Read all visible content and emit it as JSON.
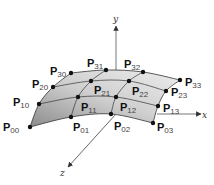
{
  "diagram": {
    "axes": {
      "x": {
        "label": "x",
        "from": [
          116,
          114
        ],
        "to": [
          201,
          114
        ]
      },
      "y": {
        "label": "y",
        "from": [
          116,
          114
        ],
        "to": [
          116,
          26
        ]
      },
      "z": {
        "label": "z",
        "from": [
          116,
          114
        ],
        "to": [
          68,
          167
        ]
      }
    },
    "axis_label_pos": {
      "x": [
        202,
        118
      ],
      "y": [
        113,
        22
      ],
      "z": [
        60,
        176
      ]
    },
    "colors": {
      "surface_light": "#e6e6e6",
      "surface_dark": "#8c8c8c",
      "grid_line": "#333333",
      "point": "#111111",
      "axis": "#555555"
    },
    "control_points": [
      {
        "id": "P00",
        "base": "P",
        "sub": "00",
        "x": 30,
        "y": 127,
        "lx": 3,
        "ly": 131
      },
      {
        "id": "P01",
        "base": "P",
        "sub": "01",
        "x": 71,
        "y": 117,
        "lx": 73,
        "ly": 131
      },
      {
        "id": "P02",
        "base": "P",
        "sub": "02",
        "x": 111,
        "y": 114,
        "lx": 114,
        "ly": 130
      },
      {
        "id": "P03",
        "base": "P",
        "sub": "03",
        "x": 153,
        "y": 123,
        "lx": 157,
        "ly": 131
      },
      {
        "id": "P10",
        "base": "P",
        "sub": "10",
        "x": 39,
        "y": 104,
        "lx": 13,
        "ly": 106
      },
      {
        "id": "P11",
        "base": "P",
        "sub": "11",
        "x": 78,
        "y": 97,
        "lx": 81,
        "ly": 111
      },
      {
        "id": "P12",
        "base": "P",
        "sub": "12",
        "x": 116,
        "y": 97,
        "lx": 120,
        "ly": 111
      },
      {
        "id": "P13",
        "base": "P",
        "sub": "13",
        "x": 158,
        "y": 106,
        "lx": 163,
        "ly": 112
      },
      {
        "id": "P20",
        "base": "P",
        "sub": "20",
        "x": 53,
        "y": 87,
        "lx": 32,
        "ly": 88
      },
      {
        "id": "P21",
        "base": "P",
        "sub": "21",
        "x": 91,
        "y": 81,
        "lx": 94,
        "ly": 94
      },
      {
        "id": "P22",
        "base": "P",
        "sub": "22",
        "x": 129,
        "y": 81,
        "lx": 132,
        "ly": 95
      },
      {
        "id": "P23",
        "base": "P",
        "sub": "23",
        "x": 166,
        "y": 91,
        "lx": 171,
        "ly": 96
      },
      {
        "id": "P30",
        "base": "P",
        "sub": "30",
        "x": 71,
        "y": 73,
        "lx": 50,
        "ly": 75
      },
      {
        "id": "P31",
        "base": "P",
        "sub": "31",
        "x": 106,
        "y": 70,
        "lx": 87,
        "ly": 67
      },
      {
        "id": "P32",
        "base": "P",
        "sub": "32",
        "x": 143,
        "y": 72,
        "lx": 124,
        "ly": 68
      },
      {
        "id": "P33",
        "base": "P",
        "sub": "33",
        "x": 180,
        "y": 80,
        "lx": 185,
        "ly": 86
      }
    ]
  }
}
